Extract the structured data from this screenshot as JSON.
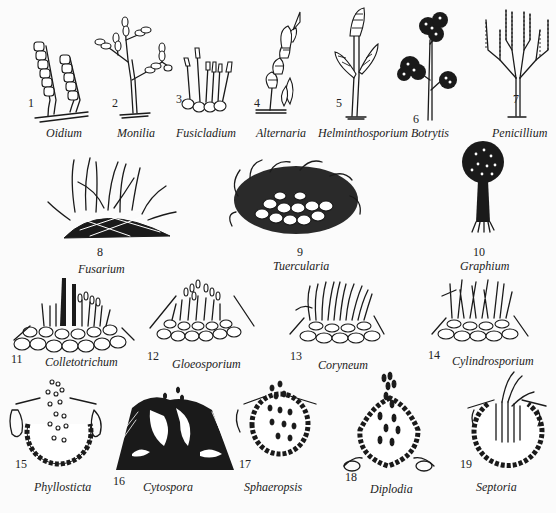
{
  "figure": {
    "items": [
      {
        "num": "1",
        "name": "Oidium"
      },
      {
        "num": "2",
        "name": "Monilia"
      },
      {
        "num": "3",
        "name": "Fusicladium"
      },
      {
        "num": "4",
        "name": "Alternaria"
      },
      {
        "num": "5",
        "name": "Helminthosporium"
      },
      {
        "num": "6",
        "name": "Botrytis"
      },
      {
        "num": "7",
        "name": "Penicillium"
      },
      {
        "num": "8",
        "name": "Fusarium"
      },
      {
        "num": "9",
        "name": "Tuercularia"
      },
      {
        "num": "10",
        "name": "Graphium"
      },
      {
        "num": "11",
        "name": "Colletotrichum"
      },
      {
        "num": "12",
        "name": "Gloeosporium"
      },
      {
        "num": "13",
        "name": "Coryneum"
      },
      {
        "num": "14",
        "name": "Cylindrosporium"
      },
      {
        "num": "15",
        "name": "Phyllosticta"
      },
      {
        "num": "16",
        "name": "Cytospora"
      },
      {
        "num": "17",
        "name": "Sphaeropsis"
      },
      {
        "num": "18",
        "name": "Diplodia"
      },
      {
        "num": "19",
        "name": "Septoria"
      }
    ]
  }
}
